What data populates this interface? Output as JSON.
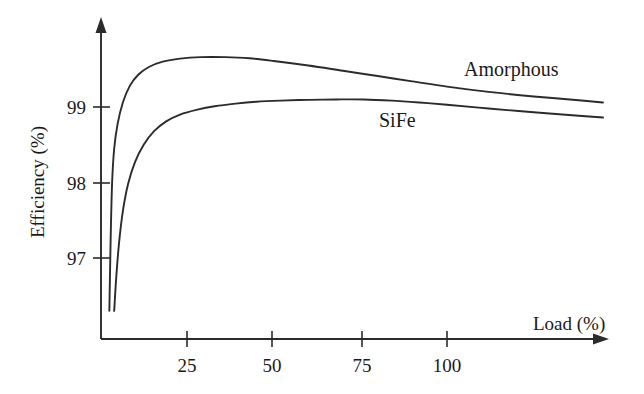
{
  "chart_data": {
    "type": "line",
    "title": "",
    "subtitle": "",
    "xlabel": "Load (%)",
    "ylabel": "Efficiency (%)",
    "xlim": [
      0,
      145
    ],
    "ylim": [
      96.3,
      99.85
    ],
    "xticks": [
      25,
      50,
      75,
      100
    ],
    "xtick_labels": [
      "25",
      "50",
      "75",
      "100"
    ],
    "yticks": [
      97,
      98,
      99
    ],
    "ytick_labels": [
      "97",
      "98",
      "99"
    ],
    "grid": false,
    "legend_position": "inline-annotation",
    "axis_style": "arrow-ended open axes",
    "series": [
      {
        "name": "Amorphous",
        "label_text": "Amorphous",
        "color": "#2b2b2b",
        "x": [
          2.6,
          3.0,
          3.4,
          4.0,
          5.0,
          6.5,
          8.5,
          11,
          14,
          18,
          23,
          29,
          36,
          43,
          50,
          60,
          70,
          80,
          90,
          100,
          112,
          125,
          138,
          145
        ],
        "y": [
          96.3,
          97.3,
          98.0,
          98.45,
          98.78,
          99.06,
          99.28,
          99.43,
          99.53,
          99.6,
          99.64,
          99.66,
          99.66,
          99.645,
          99.61,
          99.55,
          99.48,
          99.41,
          99.34,
          99.27,
          99.2,
          99.14,
          99.09,
          99.06
        ]
      },
      {
        "name": "SiFe",
        "label_text": "SiFe",
        "color": "#2b2b2b",
        "x": [
          4.0,
          4.6,
          5.4,
          6.5,
          8.0,
          10,
          12.5,
          15.5,
          19,
          23,
          28,
          33,
          39,
          45,
          52,
          60,
          68,
          76,
          84,
          92,
          100,
          112,
          125,
          138,
          145
        ],
        "y": [
          96.3,
          96.75,
          97.2,
          97.62,
          97.98,
          98.27,
          98.5,
          98.68,
          98.81,
          98.9,
          98.965,
          99.01,
          99.045,
          99.07,
          99.085,
          99.095,
          99.1,
          99.1,
          99.085,
          99.06,
          99.03,
          98.98,
          98.93,
          98.885,
          98.86
        ]
      }
    ],
    "annotations": [
      {
        "text": "Amorphous",
        "x": 118,
        "y": 99.52
      },
      {
        "text": "SiFe",
        "x": 77,
        "y": 98.87
      }
    ]
  },
  "axes": {
    "y_axis_title": "Efficiency (%)",
    "x_axis_title": "Load (%)",
    "y_tick_labels": [
      "99",
      "98",
      "97"
    ],
    "x_tick_labels": [
      "25",
      "50",
      "75",
      "100"
    ]
  },
  "series_labels": {
    "amorphous": "Amorphous",
    "sife": "SiFe"
  }
}
